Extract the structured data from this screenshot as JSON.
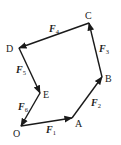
{
  "diagram": {
    "points": {
      "O": {
        "label": "O",
        "x": 21,
        "y": 126,
        "lx": 13,
        "ly": 137
      },
      "A": {
        "label": "A",
        "x": 72,
        "y": 118,
        "lx": 75,
        "ly": 127
      },
      "B": {
        "label": "B",
        "x": 102,
        "y": 77,
        "lx": 105,
        "ly": 82
      },
      "C": {
        "label": "C",
        "x": 89,
        "y": 23,
        "lx": 85,
        "ly": 19
      },
      "D": {
        "label": "D",
        "x": 19,
        "y": 48,
        "lx": 6,
        "ly": 52
      },
      "E": {
        "label": "E",
        "x": 40,
        "y": 93,
        "lx": 43,
        "ly": 98
      }
    },
    "forces": [
      {
        "name": "F",
        "sub": "1",
        "from": "O",
        "to": "A",
        "lx": 46,
        "ly": 133
      },
      {
        "name": "F",
        "sub": "2",
        "from": "A",
        "to": "B",
        "lx": 91,
        "ly": 106
      },
      {
        "name": "F",
        "sub": "3",
        "from": "B",
        "to": "C",
        "lx": 99,
        "ly": 52
      },
      {
        "name": "F",
        "sub": "4",
        "from": "C",
        "to": "D",
        "lx": 49,
        "ly": 32
      },
      {
        "name": "F",
        "sub": "5",
        "from": "D",
        "to": "E",
        "lx": 16,
        "ly": 73
      },
      {
        "name": "F",
        "sub": "6",
        "from": "E",
        "to": "O",
        "lx": 18,
        "ly": 110
      }
    ]
  }
}
